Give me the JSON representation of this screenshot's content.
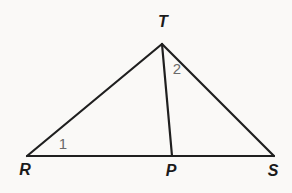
{
  "figure": {
    "background_color": "#faf9f7",
    "stroke_color": "#1f1f1f",
    "stroke_width": 2.2,
    "angle_label_color": "#6a6a6a",
    "points": {
      "R": {
        "x": 27,
        "y": 156
      },
      "T": {
        "x": 162,
        "y": 44
      },
      "S": {
        "x": 274,
        "y": 156
      },
      "P": {
        "x": 172,
        "y": 156
      }
    },
    "segments": [
      {
        "from": "R",
        "to": "T"
      },
      {
        "from": "T",
        "to": "S"
      },
      {
        "from": "R",
        "to": "S"
      },
      {
        "from": "T",
        "to": "P"
      }
    ],
    "vertex_labels": [
      {
        "text": "T",
        "x": 163,
        "y": 27
      },
      {
        "text": "R",
        "x": 25,
        "y": 175
      },
      {
        "text": "P",
        "x": 171,
        "y": 176
      },
      {
        "text": "S",
        "x": 273,
        "y": 176
      }
    ],
    "angle_labels": [
      {
        "text": "1",
        "x": 63,
        "y": 149
      },
      {
        "text": "2",
        "x": 177,
        "y": 74
      }
    ]
  }
}
